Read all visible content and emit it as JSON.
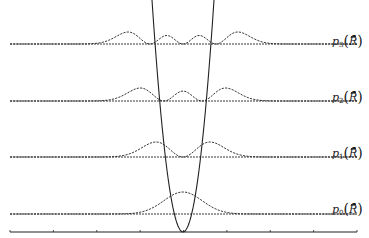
{
  "figure": {
    "axis": {
      "tick_count": 9
    },
    "levels": [
      {
        "n": 0,
        "label_symbol": "p",
        "label_sub": "0",
        "label_arg": "R̄",
        "baseline_y": 214
      },
      {
        "n": 1,
        "label_symbol": "p",
        "label_sub": "1",
        "label_arg": "R̄",
        "baseline_y": 157
      },
      {
        "n": 2,
        "label_symbol": "p",
        "label_sub": "2",
        "label_arg": "R̄",
        "baseline_y": 101
      },
      {
        "n": 3,
        "label_symbol": "p",
        "label_sub": "3",
        "label_arg": "R̄",
        "baseline_y": 44
      }
    ],
    "colors": {
      "line": "#222222",
      "background": "#ffffff"
    }
  }
}
